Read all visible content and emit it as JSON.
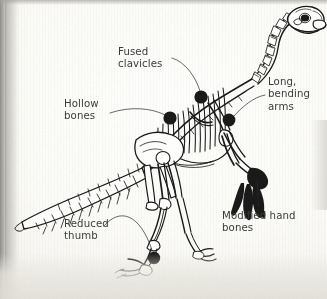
{
  "page": {
    "kind": "book-page-scan",
    "background_color": "#fdfdfb",
    "gutter_shadow_color": "#8e8c87",
    "ink_color": "#1a1a1a",
    "text_color": "#3b3b3a"
  },
  "figure": {
    "orientation": "facing right, tail to lower left",
    "marker_color": "#101010",
    "leader_line_color": "#2a2a29"
  },
  "labels": [
    {
      "id": "fused-clavicles",
      "line1": "Fused",
      "line2": "clavicles",
      "line3": ""
    },
    {
      "id": "hollow-bones",
      "line1": "Hollow",
      "line2": "bones",
      "line3": ""
    },
    {
      "id": "long-bending-arms",
      "line1": "Long,",
      "line2": "bending",
      "line3": "arms"
    },
    {
      "id": "modified-hand-bones",
      "line1": "Modified hand",
      "line2": "bones",
      "line3": ""
    },
    {
      "id": "reduced-thumb",
      "line1": "Reduced",
      "line2": "thumb",
      "line3": ""
    }
  ],
  "label_text": {
    "fused_clavicles": "Fused\nclavicles",
    "hollow_bones": "Hollow\nbones",
    "long_bending_arms": "Long,\nbending\narms",
    "modified_hand_bones": "Modified hand\nbones",
    "reduced_thumb": "Reduced\nthumb"
  }
}
